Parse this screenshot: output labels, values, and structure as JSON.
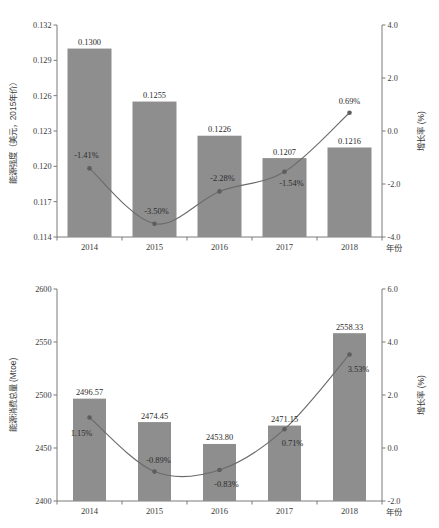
{
  "chart_data": [
    {
      "id": "energy-intensity",
      "type": "bar",
      "title": "",
      "xlabel": "年份",
      "ylabel": "能源强度（美元，2015年价）",
      "y2label": "增长率 (%)",
      "categories": [
        "2014",
        "2015",
        "2016",
        "2017",
        "2018"
      ],
      "series": [
        {
          "name": "能源强度（美元，2015年价）",
          "type": "bar",
          "values": [
            0.13,
            0.1255,
            0.1226,
            0.1207,
            0.1216
          ],
          "labels": [
            "0.1300",
            "0.1255",
            "0.1226",
            "0.1207",
            "0.1216"
          ],
          "axis": "left",
          "color": "#8e8e8e"
        },
        {
          "name": "增长率 (%)",
          "type": "line",
          "values": [
            -1.41,
            -3.5,
            -2.28,
            -1.54,
            0.69
          ],
          "labels": [
            "-1.41%",
            "-3.50%",
            "-2.28%",
            "-1.54%",
            "0.69%"
          ],
          "axis": "right",
          "color": "#6b6b6b"
        }
      ],
      "ylim": [
        0.114,
        0.132
      ],
      "yticks": [
        "0.114",
        "0.117",
        "0.120",
        "0.123",
        "0.126",
        "0.129",
        "0.132"
      ],
      "y2lim": [
        -4.0,
        4.0
      ],
      "y2ticks": [
        "-4.0",
        "-2.0",
        "0.0",
        "2.0",
        "4.0"
      ],
      "grid": false,
      "legend": "none"
    },
    {
      "id": "energy-consumption",
      "type": "bar",
      "title": "",
      "xlabel": "年份",
      "ylabel": "能源消费总量 (Mtoe)",
      "y2label": "增长率 (%)",
      "categories": [
        "2014",
        "2015",
        "2016",
        "2017",
        "2018"
      ],
      "series": [
        {
          "name": "能源消费总量 (Mtoe)",
          "type": "bar",
          "values": [
            2496.57,
            2474.45,
            2453.8,
            2471.15,
            2558.33
          ],
          "labels": [
            "2496.57",
            "2474.45",
            "2453.80",
            "2471.15",
            "2558.33"
          ],
          "axis": "left",
          "color": "#8e8e8e"
        },
        {
          "name": "增长率 (%)",
          "type": "line",
          "values": [
            1.15,
            -0.89,
            -0.83,
            0.71,
            3.53
          ],
          "labels": [
            "1.15%",
            "-0.89%",
            "-0.83%",
            "0.71%",
            "3.53%"
          ],
          "axis": "right",
          "color": "#6b6b6b"
        }
      ],
      "ylim": [
        2400,
        2600
      ],
      "yticks": [
        "2400",
        "2450",
        "2500",
        "2550",
        "2600"
      ],
      "y2lim": [
        -2.0,
        6.0
      ],
      "y2ticks": [
        "-2.0",
        "0.0",
        "2.0",
        "4.0",
        "6.0"
      ],
      "grid": false,
      "legend": "none"
    }
  ],
  "colors": {
    "bar": "#8e8e8e",
    "line": "#6b6b6b",
    "axis": "#7a7a7a",
    "text": "#2b2b2b",
    "background": "#ffffff"
  }
}
